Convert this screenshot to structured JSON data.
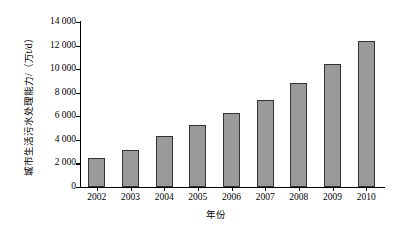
{
  "chart_data": {
    "type": "bar",
    "title": "",
    "subtitle": "",
    "xlabel": "年份",
    "ylabel": "城市生活污水处理能力/（万t/d）",
    "categories": [
      "2002",
      "2003",
      "2004",
      "2005",
      "2006",
      "2007",
      "2008",
      "2009",
      "2010"
    ],
    "values": [
      2500,
      3100,
      4300,
      5300,
      6300,
      7400,
      8800,
      10400,
      12400
    ],
    "series": [
      {
        "name": "城市生活污水处理能力",
        "values": [
          2500,
          3100,
          4300,
          5300,
          6300,
          7400,
          8800,
          10400,
          12400
        ]
      }
    ],
    "ylim": [
      0,
      14000
    ],
    "ytick_values": [
      0,
      2000,
      4000,
      6000,
      8000,
      10000,
      12000,
      14000
    ],
    "ytick_labels": [
      "0",
      "2 000",
      "4 000",
      "6 000",
      "8 000",
      "10 000",
      "12 000",
      "14 000"
    ],
    "grid": false,
    "legend": false,
    "legend_position": "none",
    "bar_color": "#9a9a9a",
    "bar_border_color": "#333333",
    "axis_color": "#000000",
    "background_color": "#ffffff"
  }
}
